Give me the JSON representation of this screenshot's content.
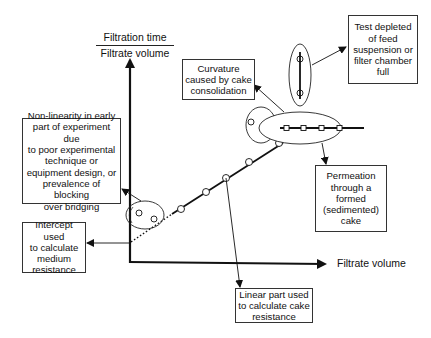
{
  "diagram": {
    "y_axis_label": {
      "numerator": "Filtration time",
      "denominator": "Filtrate volume"
    },
    "x_axis_label": "Filtrate volume",
    "annotations": [
      {
        "id": "non-linearity",
        "text": "Non-linearity in early\npart of experiment due\nto poor experimental\ntechnique or\nequipment design, or\nprevalence of blocking\nover bridging"
      },
      {
        "id": "intercept",
        "text": "Intercept used\nto calculate\nmedium\nresistance"
      },
      {
        "id": "curvature",
        "text": "Curvature\ncaused by cake\nconsolidation"
      },
      {
        "id": "test-depleted",
        "text": "Test depleted\nof feed\nsuspension or\nfilter chamber\nfull"
      },
      {
        "id": "permeation",
        "text": "Permeation\nthrough a\nformed\n(sedimented)\ncake"
      },
      {
        "id": "linear-part",
        "text": "Linear part used\nto calculate cake\nresistance"
      }
    ],
    "regions": [
      "early non-linear region (circles)",
      "linear region (circles on straight line)",
      "curvature region",
      "vertical region (test depleted)",
      "horizontal region (squares, permeation)"
    ]
  }
}
